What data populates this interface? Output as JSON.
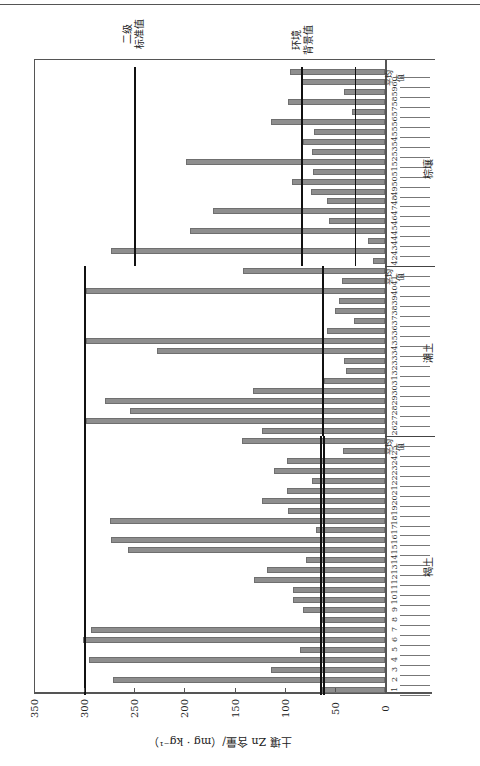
{
  "page": {
    "caption": "图 7-3  山东省农田土壤 Zn 全量分布"
  },
  "chart_data": {
    "type": "bar",
    "orientation": "horizontal bars (page rotated 90°)",
    "xlabel": "土壤 Zn 含量/（mg · kg⁻¹）",
    "ylabel": "样点编号",
    "xlim": [
      0,
      350
    ],
    "x_ticks": [
      0,
      50,
      100,
      150,
      200,
      250,
      300,
      350
    ],
    "grid": false,
    "groups": [
      {
        "name": "褐土",
        "categories": [
          "1",
          "2",
          "3",
          "4",
          "5",
          "6",
          "7",
          "8",
          "9",
          "10",
          "11",
          "12",
          "13",
          "14",
          "15",
          "16",
          "17",
          "18",
          "19",
          "20",
          "21",
          "22",
          "23",
          "24",
          "25",
          "平均值"
        ],
        "values": [
          63,
          271,
          114,
          295,
          85,
          301,
          293,
          63,
          82,
          92,
          92,
          131,
          118,
          79,
          256,
          273,
          69,
          274,
          97,
          123,
          98,
          73,
          111,
          98,
          42,
          143
        ],
        "reference_lines": [
          {
            "name": "二级标准值",
            "value": 300
          },
          {
            "name": "环境背景值",
            "value": 62
          },
          {
            "name": "环境背景值",
            "value": 65
          }
        ]
      },
      {
        "name": "潮土",
        "categories": [
          "26",
          "27",
          "28",
          "29",
          "30",
          "31",
          "32",
          "33",
          "34",
          "35",
          "36",
          "37",
          "38",
          "39",
          "40",
          "41",
          "平均值"
        ],
        "values": [
          123,
          298,
          254,
          279,
          132,
          61,
          39,
          41,
          227,
          298,
          58,
          31,
          50,
          46,
          298,
          43,
          142
        ],
        "reference_lines": [
          {
            "name": "二级标准值",
            "value": 300
          },
          {
            "name": "环境背景值",
            "value": 63
          }
        ]
      },
      {
        "name": "棕壤",
        "categories": [
          "42",
          "43",
          "44",
          "45",
          "46",
          "47",
          "48",
          "49",
          "50",
          "51",
          "52",
          "53",
          "54",
          "55",
          "56",
          "57",
          "58",
          "59",
          "60",
          "平均值"
        ],
        "values": [
          12,
          273,
          17,
          194,
          56,
          171,
          58,
          74,
          93,
          72,
          198,
          73,
          82,
          71,
          114,
          33,
          97,
          41,
          83,
          95
        ],
        "reference_lines": [
          {
            "name": "二级标准值",
            "value": 250
          },
          {
            "name": "环境背景值",
            "value": 84
          },
          {
            "name": "环境背景值",
            "value": 30
          }
        ]
      }
    ],
    "annotations": [
      "二级\n标准值",
      "环境\n背景值"
    ],
    "bar_color": "#8e8e8e",
    "reference_line_color": "#111111"
  }
}
